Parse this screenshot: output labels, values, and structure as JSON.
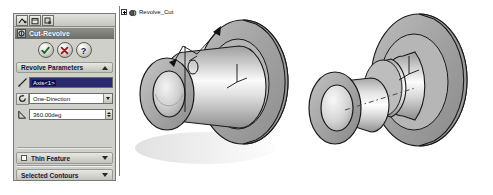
{
  "app": {
    "title": "SolidWorks PropertyManager - Cut-Revolve"
  },
  "property_manager": {
    "tabs": [
      {
        "name": "feature-manager-tree-tab",
        "icon": "tree-icon",
        "label": "FeatureManager Design Tree"
      },
      {
        "name": "property-manager-tab",
        "icon": "property-manager-icon",
        "label": "PropertyManager"
      },
      {
        "name": "configuration-manager-tab",
        "icon": "configuration-manager-icon",
        "label": "ConfigurationManager"
      }
    ],
    "title": "Cut-Revolve",
    "title_icon": "cut-revolve-icon",
    "actions": [
      {
        "name": "ok-button",
        "icon": "check-icon",
        "label": "OK",
        "color": "#1a7a2a"
      },
      {
        "name": "cancel-button",
        "icon": "x-icon",
        "label": "Cancel",
        "color": "#b21c1c"
      },
      {
        "name": "help-button",
        "icon": "question-icon",
        "label": "Help",
        "color": "#1a1a6e"
      }
    ],
    "sections": {
      "revolve_parameters": {
        "label": "Revolve Parameters",
        "state": "expanded",
        "chevron": "chevron-up-icon",
        "axis": {
          "icon": "axis-icon",
          "value": "Axis<1>",
          "placeholder": "Select an axis"
        },
        "direction": {
          "icon": "revolve-direction-icon",
          "value": "One-Direction",
          "options": [
            "One-Direction",
            "Mid-Plane",
            "Two-Direction"
          ],
          "arrow": "chevron-down-icon"
        },
        "angle": {
          "icon": "angle-icon",
          "value": "360.00deg",
          "placeholder": "Angle",
          "spinner": "spinner-icon"
        }
      },
      "thin_feature": {
        "label": "Thin Feature",
        "checkbox": "checkbox-unchecked",
        "checked": false,
        "state": "collapsed",
        "chevron": "chevron-down-icon"
      },
      "selected_contours": {
        "label": "Selected Contours",
        "state": "collapsed",
        "chevron": "chevron-down-icon"
      }
    }
  },
  "graphics": {
    "tree_node": {
      "expander": "plus-icon",
      "icon": "revolve-cut-feature-icon",
      "label": "Revolve_Cut"
    },
    "models": [
      {
        "name": "preview-model-left",
        "description": "Isometric shaded preview of revolved cut bushing - flange with cylindrical boss and through bore, with revolve axis and angle annotation arrows"
      },
      {
        "name": "result-model-right",
        "description": "Isometric shaded result of revolved cut - stepped flanged bushing with grooved collar and centerline"
      }
    ]
  }
}
